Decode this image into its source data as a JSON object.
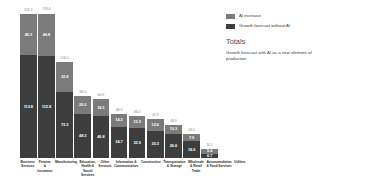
{
  "legend": {
    "position": "top-right",
    "items": [
      {
        "label": "AI increase",
        "color": "#7b7b7b",
        "icon": "legend-swatch-icon"
      },
      {
        "label": "Growth forecast without AI",
        "color": "#3d3d3d",
        "icon": "legend-swatch-icon"
      }
    ]
  },
  "totals_panel": {
    "heading": "Totals",
    "description": "Growth forecast with AI as a new element of production"
  },
  "chart_data": {
    "type": "bar",
    "subtype": "stacked-vertical",
    "title": "",
    "subtitle": "",
    "xlabel": "",
    "ylabel": "",
    "ylim": [
      0,
      159.1
    ],
    "grid": false,
    "legend_position": "top-right",
    "colors": {
      "ai_increase": "#7b7b7b",
      "growth_without_ai": "#3d3d3d",
      "total_label": "#8a8a8a",
      "category_label": "#2b2b2b",
      "background": "#ffffff"
    },
    "categories": [
      "Business Services",
      "Finance & Insurance",
      "Manufacturing",
      "Education, Health & Social Services",
      "Other Services",
      "Information & Communication",
      "Construction",
      "Transportation & Storage",
      "Wholesale & Retail Trade",
      "Accommodation & Food Services",
      "Utilities"
    ],
    "series": [
      {
        "name": "Growth forecast without AI",
        "color": "#3d3d3d",
        "values": [
          113.8,
          112.8,
          73.3,
          48.3,
          46.8,
          34.7,
          32.9,
          30.3,
          26.6,
          18.6,
          6.7
        ]
      },
      {
        "name": "AI increase",
        "color": "#7b7b7b",
        "values": [
          45.3,
          46.8,
          32.8,
          20.3,
          18.1,
          14.2,
          13.3,
          12.6,
          10.3,
          7.9,
          5.4
        ]
      }
    ],
    "totals": [
      159.1,
      159.6,
      106.1,
      68.5,
      64.9,
      48.9,
      46.2,
      42.9,
      36.9,
      26.5,
      10.1
    ]
  }
}
